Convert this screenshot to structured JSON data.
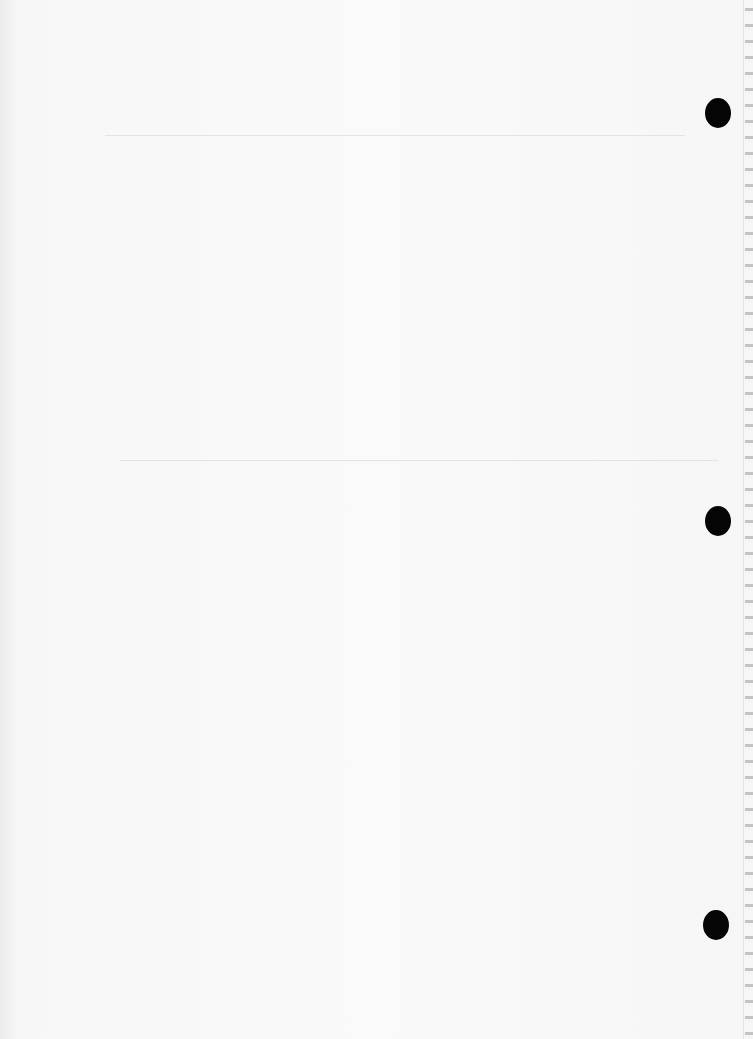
{
  "page": {
    "type": "scanned blank page",
    "background_color": "#f7f7f7",
    "rules": [
      {
        "y": 135,
        "x_start": 105,
        "x_end": 685
      },
      {
        "y": 460,
        "x_start": 120,
        "x_end": 718
      }
    ],
    "punch_holes": [
      {
        "x": 705,
        "y": 98,
        "color": "#050505"
      },
      {
        "x": 705,
        "y": 506,
        "color": "#050505"
      },
      {
        "x": 703,
        "y": 910,
        "color": "#050505"
      }
    ],
    "edge_marks": "illegible bleed-through marks along right edge"
  }
}
